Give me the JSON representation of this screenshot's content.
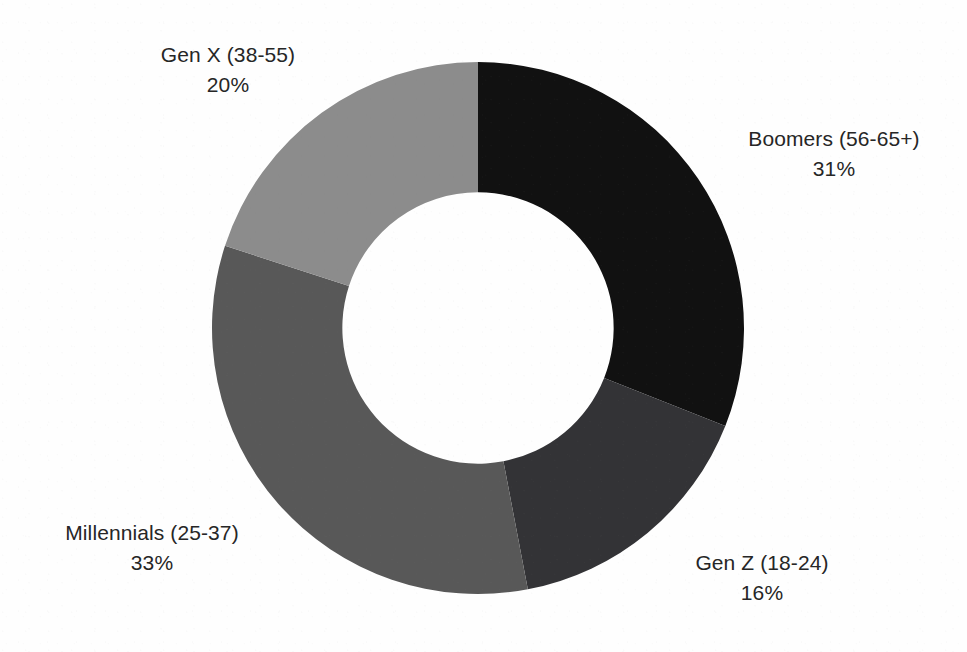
{
  "page": {
    "background_color": "#fefefe",
    "text_color": "#262626"
  },
  "chart_data": {
    "type": "pie",
    "variant": "donut",
    "title": "",
    "subtitle": "",
    "xlabel": "",
    "ylabel": "",
    "legend_position": "none",
    "labels_position": "outside",
    "grid": false,
    "units": "percent",
    "total": 100,
    "start_angle_deg": 0,
    "direction": "clockwise",
    "hole_ratio": 0.51,
    "categories": [
      "Boomers (56-65+)",
      "Gen Z (18-24)",
      "Millennials (25-37)",
      "Gen X (38-55)"
    ],
    "values": [
      31,
      16,
      33,
      20
    ],
    "value_labels": [
      "31%",
      "16%",
      "33%",
      "20%"
    ],
    "colors": [
      "#111111",
      "#333336",
      "#585858",
      "#8c8c8c"
    ],
    "slices": [
      {
        "id": "boomers",
        "label": "Boomers (56-65+)",
        "value": 31,
        "value_label": "31%",
        "color": "#111111",
        "start_deg": 0,
        "end_deg": 111.6
      },
      {
        "id": "genz",
        "label": "Gen Z (18-24)",
        "value": 16,
        "value_label": "16%",
        "color": "#333336",
        "start_deg": 111.6,
        "end_deg": 169.2
      },
      {
        "id": "millennials",
        "label": "Millennials (25-37)",
        "value": 33,
        "value_label": "33%",
        "color": "#585858",
        "start_deg": 169.2,
        "end_deg": 288.0
      },
      {
        "id": "genx",
        "label": "Gen X (38-55)",
        "value": 20,
        "value_label": "20%",
        "color": "#8c8c8c",
        "start_deg": 288.0,
        "end_deg": 360.0
      }
    ]
  }
}
